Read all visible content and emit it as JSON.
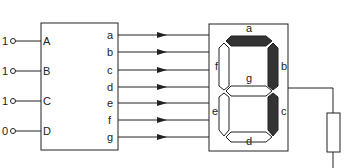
{
  "decoder": {
    "inputs": [
      {
        "label": "A",
        "value": "1"
      },
      {
        "label": "B",
        "value": "1"
      },
      {
        "label": "C",
        "value": "1"
      },
      {
        "label": "D",
        "value": "0"
      }
    ],
    "outputs": [
      "a",
      "b",
      "c",
      "d",
      "e",
      "f",
      "g"
    ]
  },
  "display": {
    "segments": {
      "a": {
        "label": "a",
        "lit": true
      },
      "b": {
        "label": "b",
        "lit": true
      },
      "c": {
        "label": "c",
        "lit": true
      },
      "d": {
        "label": "d",
        "lit": false
      },
      "e": {
        "label": "e",
        "lit": false
      },
      "f": {
        "label": "f",
        "lit": false
      },
      "g": {
        "label": "g",
        "lit": false
      }
    }
  },
  "colors": {
    "lit_segment": "#333333",
    "unlit_segment": "#ffffff",
    "stroke": "#222222"
  }
}
